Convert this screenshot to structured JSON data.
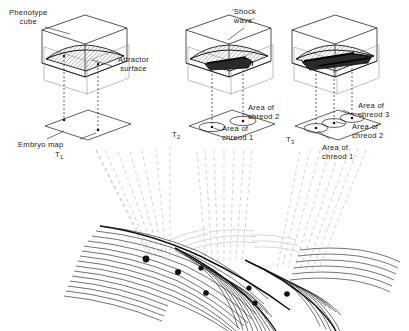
{
  "figure": {
    "background_color": "#ffffff",
    "ink_color": "#1a1a1a",
    "projection_line_color": "#b9b9b9",
    "hatch_color": "#555555",
    "width": 409,
    "height": 331
  },
  "labels": {
    "phenotype_cube": {
      "line1": "Phenotype",
      "line2": "cube"
    },
    "attractor_surface": {
      "line1": "Attractor",
      "line2": "surface"
    },
    "shock_wave": {
      "line1": "'Shock",
      "line2": "wave'"
    },
    "embryo_map": {
      "text": "Embryo  map"
    },
    "time_1": {
      "base": "T",
      "sub": "1"
    },
    "time_2": {
      "base": "T",
      "sub": "2"
    },
    "time_3": {
      "base": "T",
      "sub": "3"
    },
    "area_chreod_1_mid": {
      "line1": "Area  of",
      "line2": "chreod  1"
    },
    "area_chreod_2_mid": {
      "line1": "Area  of",
      "line2": "chreod 2"
    },
    "area_chreod_1_right": {
      "line1": "Area  of",
      "line2": "chreod  1"
    },
    "area_chreod_2_right": {
      "line1": "Area  of",
      "line2": "chreod  2"
    },
    "area_chreod_3_right": {
      "line1": "Area  of",
      "line2": "chreod 3"
    }
  },
  "panels": [
    {
      "id": "panel-t1",
      "time": "T1",
      "cube_label": "Phenotype cube",
      "surface_label": "Attractor surface",
      "map_label": "Embryo map",
      "chreod_areas": 0,
      "shock_wave": false
    },
    {
      "id": "panel-t2",
      "time": "T2",
      "shock_wave": true,
      "chreod_areas": 2,
      "chreod_area_labels": [
        "Area of chreod 1",
        "Area of chreod 2"
      ]
    },
    {
      "id": "panel-t3",
      "time": "T3",
      "shock_wave": true,
      "chreod_areas": 3,
      "chreod_area_labels": [
        "Area of chreod 1",
        "Area of chreod 2",
        "Area of chreod 3"
      ]
    }
  ],
  "landscape": {
    "name": "epigenetic-landscape",
    "valley_count": 3,
    "marker_count": 7,
    "description": "Contoured surface with branching valleys (chreods) and marker points"
  }
}
